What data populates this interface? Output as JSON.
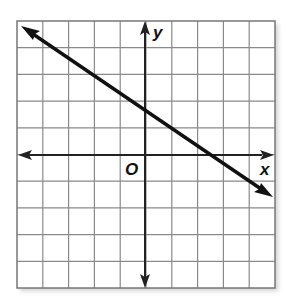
{
  "graph": {
    "x_axis_label": "x",
    "y_axis_label": "y",
    "origin_label": "O",
    "grid": {
      "columns": 10,
      "rows": 10,
      "x_range": [
        -5,
        5
      ],
      "y_range": [
        -5,
        5
      ]
    },
    "line": {
      "description": "line with negative slope",
      "y_intercept": 1.67,
      "x_intercept": 2.5,
      "slope": -0.67,
      "arrows": "both ends"
    },
    "colors": {
      "grid": "#8a8a8a",
      "axis": "#222222",
      "line": "#111111"
    }
  }
}
